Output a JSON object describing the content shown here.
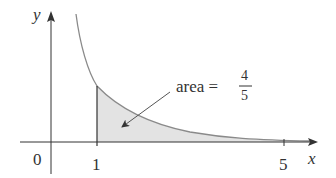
{
  "figure": {
    "function": "y = 1/x^2",
    "axes": {
      "x_label": "x",
      "y_label": "y",
      "origin_label": "0",
      "x_ticks": [
        {
          "value": 1,
          "label": "1"
        },
        {
          "value": 5,
          "label": "5"
        }
      ]
    },
    "shaded_region": {
      "from": 1,
      "to": 5
    },
    "annotation": {
      "text": "area =",
      "numerator": "4",
      "denominator": "5"
    },
    "colors": {
      "curve": "#8a8a8a",
      "shade": "#e3e3e3",
      "axis": "#333333"
    }
  }
}
